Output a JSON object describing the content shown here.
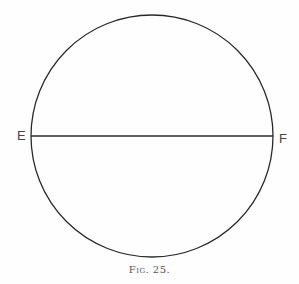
{
  "figure": {
    "caption": "Fig. 25.",
    "circle": {
      "cx": 152,
      "cy": 136,
      "r": 121
    },
    "diameter": {
      "from_label": "E",
      "to_label": "F"
    },
    "colors": {
      "stroke": "#2a2a2a",
      "text": "#444444"
    }
  }
}
